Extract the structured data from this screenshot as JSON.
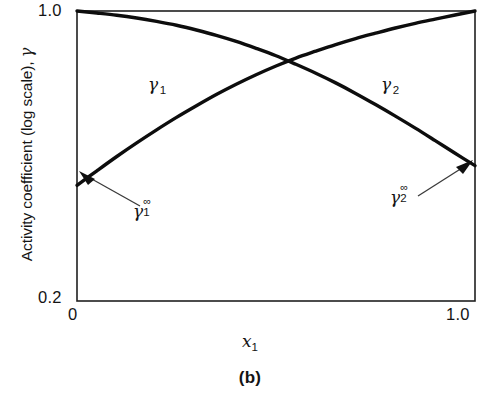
{
  "chart_data": {
    "type": "line",
    "title": "",
    "caption": "(b)",
    "xlabel": "x",
    "xlabel_sub": "1",
    "ylabel": "Activity coefficient (log scale), ",
    "ylabel_symbol": "γ",
    "x_ticks": [
      "0",
      "1.0"
    ],
    "y_ticks": [
      "1.0",
      "0.2"
    ],
    "xlim": [
      0,
      1.0
    ],
    "ylim": [
      0.2,
      1.0
    ],
    "y_scale": "log",
    "grid": false,
    "legend": "none",
    "series": [
      {
        "name": "γ",
        "name_sub": "1",
        "label": "γ 1",
        "x": [
          0,
          0.05,
          0.1,
          0.15,
          0.2,
          0.25,
          0.3,
          0.35,
          0.4,
          0.45,
          0.5,
          0.55,
          0.6,
          0.65,
          0.7,
          0.75,
          0.8,
          0.85,
          0.9,
          0.95,
          1.0
        ],
        "y": [
          0.38,
          0.412,
          0.446,
          0.481,
          0.517,
          0.554,
          0.591,
          0.629,
          0.666,
          0.702,
          0.737,
          0.77,
          0.8,
          0.83,
          0.858,
          0.884,
          0.91,
          0.934,
          0.956,
          0.978,
          1.0
        ]
      },
      {
        "name": "γ",
        "name_sub": "2",
        "label": "γ 2",
        "x": [
          0,
          0.05,
          0.1,
          0.15,
          0.2,
          0.25,
          0.3,
          0.35,
          0.4,
          0.45,
          0.5,
          0.55,
          0.6,
          0.65,
          0.7,
          0.75,
          0.8,
          0.85,
          0.9,
          0.95,
          1.0
        ],
        "y": [
          1.0,
          0.989,
          0.977,
          0.962,
          0.944,
          0.924,
          0.9,
          0.874,
          0.845,
          0.813,
          0.78,
          0.744,
          0.708,
          0.671,
          0.633,
          0.595,
          0.558,
          0.522,
          0.487,
          0.454,
          0.424
        ]
      }
    ],
    "annotations": [
      {
        "name": "gamma-1-infinity",
        "symbol": "γ",
        "sub": "1",
        "sup": "∞",
        "points_to": "left endpoint of gamma 1 curve"
      },
      {
        "name": "gamma-2-infinity",
        "symbol": "γ",
        "sub": "2",
        "sup": "∞",
        "points_to": "right endpoint of gamma 2 curve"
      }
    ]
  }
}
